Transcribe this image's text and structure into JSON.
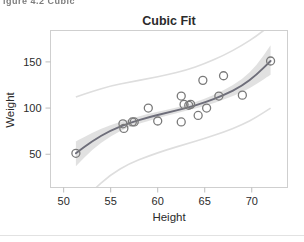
{
  "figure": {
    "caption_fragment": "igure  4.2    Cubic ",
    "background": "#ffffff"
  },
  "chart_data": {
    "type": "scatter",
    "title": "Cubic Fit",
    "xlabel": "Height",
    "ylabel": "Weight",
    "xlim": [
      48.6,
      73.8
    ],
    "ylim": [
      14,
      184
    ],
    "xticks": [
      50,
      55,
      60,
      65,
      70
    ],
    "yticks": [
      50,
      100,
      150
    ],
    "grid": false,
    "legend": null,
    "marker": {
      "shape": "circle-open",
      "color": "#7a7a7a",
      "size": 4
    },
    "points": [
      {
        "x": 51.3,
        "y": 51
      },
      {
        "x": 56.3,
        "y": 83
      },
      {
        "x": 56.4,
        "y": 78
      },
      {
        "x": 57.3,
        "y": 85
      },
      {
        "x": 57.5,
        "y": 85
      },
      {
        "x": 59.0,
        "y": 100
      },
      {
        "x": 60.0,
        "y": 86
      },
      {
        "x": 62.5,
        "y": 113
      },
      {
        "x": 62.5,
        "y": 85
      },
      {
        "x": 62.8,
        "y": 104
      },
      {
        "x": 63.3,
        "y": 103
      },
      {
        "x": 63.5,
        "y": 104
      },
      {
        "x": 64.3,
        "y": 92
      },
      {
        "x": 64.8,
        "y": 130
      },
      {
        "x": 65.2,
        "y": 100
      },
      {
        "x": 66.5,
        "y": 113
      },
      {
        "x": 67.0,
        "y": 135
      },
      {
        "x": 69.0,
        "y": 114
      },
      {
        "x": 72.0,
        "y": 151
      }
    ],
    "fit_curve": {
      "name": "cubic fit",
      "color": "#6e6e7a",
      "x": [
        51.3,
        53.0,
        55.0,
        57.0,
        59.0,
        61.0,
        63.0,
        65.0,
        67.0,
        69.0,
        70.5,
        72.0
      ],
      "y": [
        51,
        64,
        76,
        84,
        90,
        95,
        100,
        106,
        114,
        124,
        136,
        151
      ]
    },
    "confidence_band": {
      "name": "mean confidence limits",
      "fill": "#c9c9c9",
      "upper": [
        64,
        73,
        82,
        88,
        94,
        98,
        103,
        110,
        119,
        131,
        146,
        168
      ],
      "lower": [
        37,
        55,
        70,
        80,
        86,
        92,
        97,
        102,
        109,
        117,
        126,
        136
      ]
    },
    "prediction_band": {
      "name": "prediction limits",
      "stroke": "#dedede",
      "upper": [
        112,
        118,
        124,
        128,
        132,
        136,
        141,
        148,
        157,
        168,
        178,
        190
      ],
      "lower": [
        -10,
        10,
        28,
        40,
        48,
        55,
        61,
        67,
        74,
        82,
        90,
        100
      ]
    }
  }
}
